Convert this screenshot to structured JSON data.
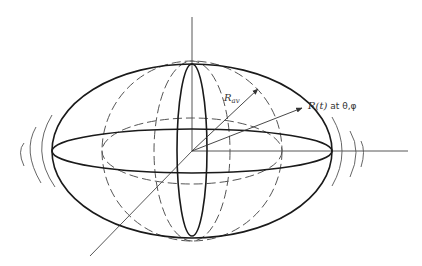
{
  "diagram": {
    "type": "deformed-sphere-oscillation",
    "labels": {
      "r_av": "R",
      "r_av_sub": "av",
      "r_t_main": "R(t)",
      "r_t_suffix": " at θ,φ"
    },
    "colors": {
      "stroke": "#1a1a1a",
      "axis": "#444444",
      "dashed": "#555555",
      "background": "#ffffff"
    }
  }
}
